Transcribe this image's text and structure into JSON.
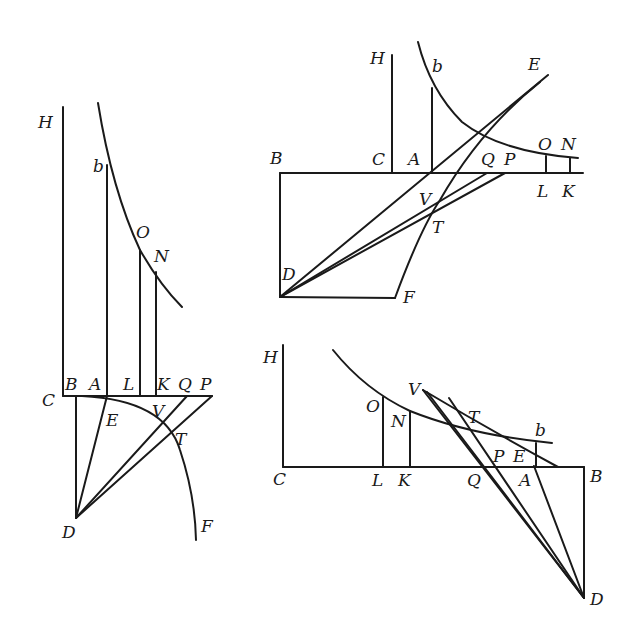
{
  "figures": [
    {
      "id": "left",
      "labels": {
        "H": "H",
        "b": "b",
        "O": "O",
        "N": "N",
        "C": "C",
        "B": "B",
        "A": "A",
        "L": "L",
        "K": "K",
        "Q": "Q",
        "P": "P",
        "E": "E",
        "V": "V",
        "T": "T",
        "D": "D",
        "F": "F"
      }
    },
    {
      "id": "top-right",
      "labels": {
        "H": "H",
        "b": "b",
        "E": "E",
        "B": "B",
        "C": "C",
        "A": "A",
        "Q": "Q",
        "P": "P",
        "O": "O",
        "N": "N",
        "L": "L",
        "K": "K",
        "V": "V",
        "T": "T",
        "D": "D",
        "F": "F"
      }
    },
    {
      "id": "bottom-right",
      "labels": {
        "H": "H",
        "O": "O",
        "N": "N",
        "V": "V",
        "T": "T",
        "b": "b",
        "P": "P",
        "E": "E",
        "C": "C",
        "L": "L",
        "K": "K",
        "Q": "Q",
        "A": "A",
        "B": "B",
        "D": "D"
      }
    }
  ]
}
